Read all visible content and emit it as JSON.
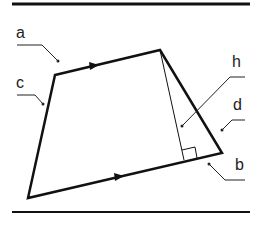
{
  "diagram": {
    "type": "trapezoid with height",
    "labels": {
      "a": "a",
      "b": "b",
      "c": "c",
      "d": "d",
      "h": "h"
    },
    "colors": {
      "stroke": "#111111",
      "leader": "#222222",
      "background": "#ffffff"
    },
    "vertices": {
      "top_left": [
        55,
        75
      ],
      "top_right": [
        160,
        50
      ],
      "bottom_right": [
        222,
        153
      ],
      "bottom_left": [
        28,
        198
      ]
    },
    "height_foot": [
      184,
      160
    ]
  }
}
